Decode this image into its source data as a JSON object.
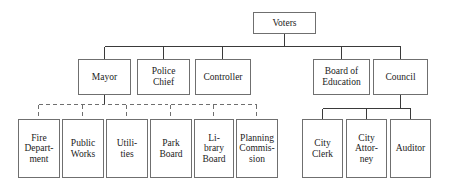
{
  "diagram": {
    "type": "organization-chart",
    "style": {
      "background": "#ffffff",
      "box_border": "#6f6f6f",
      "line_solid": "#3a3a3a",
      "line_dashed": "#6f6f6f",
      "text": "#1b1b1b"
    },
    "nodes": {
      "voters": "Voters",
      "mayor": "Mayor",
      "police_chief": "Police\nChief",
      "controller": "Controller",
      "board_of_education": "Board of\nEducation",
      "council": "Council",
      "fire_department": "Fire\nDepart-\nment",
      "public_works": "Public\nWorks",
      "utilities": "Utili-\nties",
      "park_board": "Park\nBoard",
      "library_board": "Li-\nbrary\nBoard",
      "planning_commission": "Planning\nCommis-\nsion",
      "city_clerk": "City\nClerk",
      "city_attorney": "City\nAttor-\nney",
      "auditor": "Auditor"
    },
    "relationships": [
      {
        "from": "voters",
        "to": "mayor",
        "line": "solid"
      },
      {
        "from": "voters",
        "to": "police_chief",
        "line": "solid"
      },
      {
        "from": "voters",
        "to": "controller",
        "line": "solid"
      },
      {
        "from": "voters",
        "to": "board_of_education",
        "line": "solid"
      },
      {
        "from": "voters",
        "to": "council",
        "line": "solid"
      },
      {
        "from": "mayor",
        "to": "fire_department",
        "line": "dashed"
      },
      {
        "from": "mayor",
        "to": "public_works",
        "line": "dashed"
      },
      {
        "from": "mayor",
        "to": "utilities",
        "line": "dashed"
      },
      {
        "from": "mayor",
        "to": "park_board",
        "line": "dashed"
      },
      {
        "from": "mayor",
        "to": "library_board",
        "line": "dashed"
      },
      {
        "from": "mayor",
        "to": "planning_commission",
        "line": "dashed"
      },
      {
        "from": "council",
        "to": "city_clerk",
        "line": "solid"
      },
      {
        "from": "council",
        "to": "city_attorney",
        "line": "solid"
      },
      {
        "from": "council",
        "to": "auditor",
        "line": "solid"
      }
    ]
  }
}
